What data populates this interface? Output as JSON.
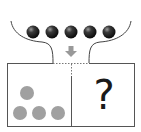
{
  "diagram": {
    "type": "puzzle-funnel",
    "funnel": {
      "balls_count": 5,
      "ball_color": "#1a1a1a",
      "arrow": "down-arrow-icon",
      "arrow_color": "#999999"
    },
    "box": {
      "left_compartment": {
        "balls_count": 4,
        "ball_color": "#a0a0a0",
        "arrangement": "1 on top, 3 on bottom"
      },
      "right_compartment": {
        "label": "?"
      },
      "border_color": "#555555"
    }
  }
}
